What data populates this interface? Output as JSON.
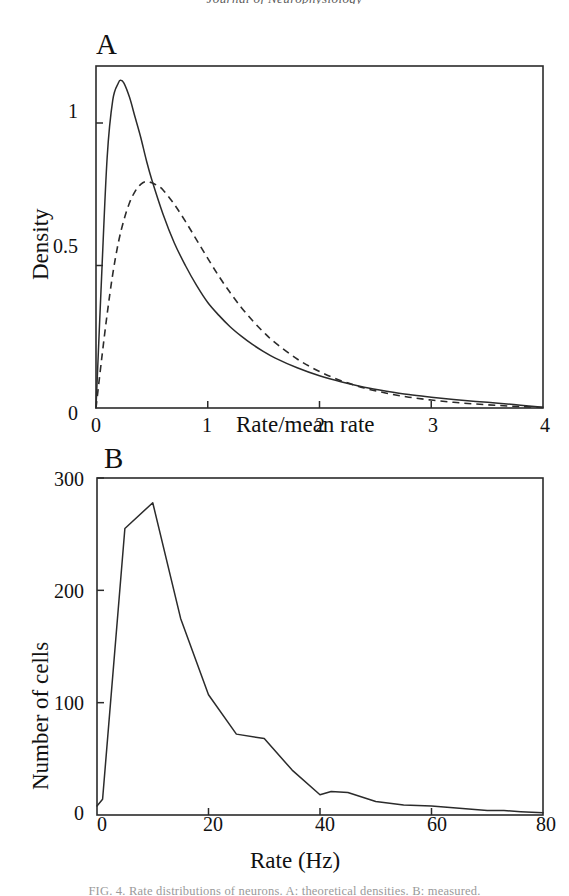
{
  "page": {
    "header_sliver": "Journal of Neurophysiology",
    "footer_sliver": "FIG. 4. Rate distributions of neurons. A: theoretical densities. B: measured."
  },
  "figure": {
    "panels": [
      {
        "label": "A",
        "xlabel": "Rate/mean rate",
        "ylabel": "Density",
        "xticks": [
          "0",
          "1",
          "2",
          "3",
          "4"
        ],
        "yticks": [
          "0",
          "0.5",
          "1"
        ]
      },
      {
        "label": "B",
        "xlabel": "Rate (Hz)",
        "ylabel": "Number of cells",
        "xticks": [
          "0",
          "20",
          "40",
          "60",
          "80"
        ],
        "yticks": [
          "0",
          "100",
          "200",
          "300"
        ]
      }
    ]
  },
  "chart_data": [
    {
      "type": "line",
      "panel": "A",
      "title": "",
      "xlabel": "Rate/mean rate",
      "ylabel": "Density",
      "xlim": [
        0,
        4
      ],
      "ylim": [
        0,
        1.2
      ],
      "xticks": [
        0,
        1,
        2,
        3,
        4
      ],
      "yticks": [
        0,
        0.5,
        1
      ],
      "grid": false,
      "legend": "none",
      "series": [
        {
          "name": "solid-curve",
          "style": "solid",
          "x": [
            0,
            0.05,
            0.1,
            0.15,
            0.2,
            0.22,
            0.25,
            0.3,
            0.35,
            0.4,
            0.45,
            0.5,
            0.6,
            0.7,
            0.8,
            0.9,
            1.0,
            1.1,
            1.2,
            1.3,
            1.4,
            1.5,
            1.6,
            1.8,
            2.0,
            2.2,
            2.4,
            2.6,
            2.8,
            3.0,
            3.2,
            3.4,
            3.6,
            3.8,
            4.0
          ],
          "y": [
            0,
            0.46,
            0.88,
            1.08,
            1.14,
            1.15,
            1.14,
            1.09,
            1.02,
            0.95,
            0.87,
            0.8,
            0.68,
            0.58,
            0.5,
            0.43,
            0.37,
            0.325,
            0.285,
            0.252,
            0.223,
            0.198,
            0.176,
            0.141,
            0.113,
            0.091,
            0.073,
            0.059,
            0.047,
            0.038,
            0.03,
            0.023,
            0.017,
            0.01,
            0.003
          ]
        },
        {
          "name": "dashed-curve",
          "style": "dashed",
          "x": [
            0,
            0.05,
            0.1,
            0.15,
            0.2,
            0.25,
            0.3,
            0.35,
            0.4,
            0.45,
            0.5,
            0.55,
            0.6,
            0.7,
            0.8,
            0.9,
            1.0,
            1.1,
            1.2,
            1.3,
            1.4,
            1.5,
            1.6,
            1.8,
            2.0,
            2.2,
            2.4,
            2.6,
            2.8,
            3.0,
            3.2,
            3.4,
            3.6,
            3.8,
            4.0
          ],
          "y": [
            0,
            0.17,
            0.33,
            0.47,
            0.58,
            0.66,
            0.72,
            0.76,
            0.785,
            0.795,
            0.79,
            0.78,
            0.765,
            0.715,
            0.655,
            0.59,
            0.525,
            0.462,
            0.405,
            0.353,
            0.307,
            0.266,
            0.23,
            0.172,
            0.128,
            0.095,
            0.07,
            0.052,
            0.038,
            0.028,
            0.02,
            0.014,
            0.009,
            0.005,
            0.002
          ]
        }
      ]
    },
    {
      "type": "line",
      "panel": "B",
      "title": "",
      "xlabel": "Rate (Hz)",
      "ylabel": "Number of cells",
      "xlim": [
        0,
        80
      ],
      "ylim": [
        0,
        300
      ],
      "xticks": [
        0,
        20,
        40,
        60,
        80
      ],
      "yticks": [
        0,
        100,
        200,
        300
      ],
      "grid": false,
      "legend": "none",
      "series": [
        {
          "name": "cell-count-histogram",
          "style": "solid",
          "x": [
            0,
            1,
            5,
            10,
            15,
            20,
            25,
            30,
            35,
            40,
            42,
            45,
            50,
            55,
            60,
            65,
            70,
            73,
            76,
            80
          ],
          "y": [
            8,
            14,
            255,
            278,
            175,
            107,
            72,
            68,
            40,
            18,
            21,
            20,
            12,
            9,
            8,
            6,
            4,
            4,
            3,
            2
          ]
        }
      ]
    }
  ]
}
